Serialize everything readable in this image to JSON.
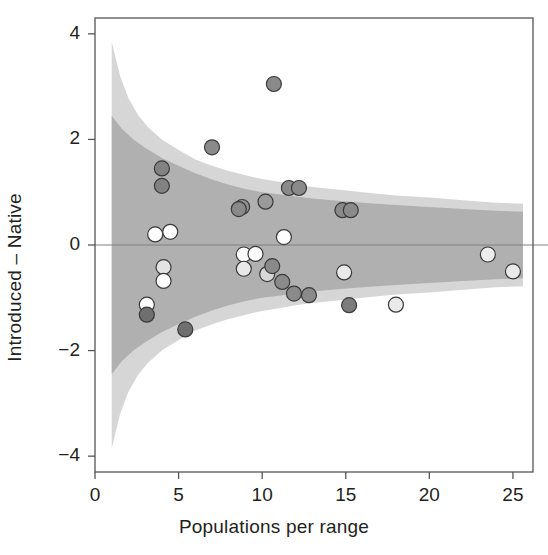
{
  "chart_data": {
    "type": "scatter",
    "title": "",
    "xlabel": "Populations per range",
    "ylabel": "Introduced – Native",
    "xlim": [
      0,
      26.2
    ],
    "ylim": [
      -4.3,
      4.3
    ],
    "xticks": [
      0,
      5,
      10,
      15,
      20,
      25
    ],
    "xtick_labels": [
      "0",
      "5",
      "10",
      "15",
      "20",
      "25"
    ],
    "yticks": [
      -4,
      -2,
      0,
      2,
      4
    ],
    "ytick_labels": [
      "-4",
      "-2",
      "0",
      "2",
      "4"
    ],
    "grid": false,
    "legend": null,
    "reference_line": {
      "y": 0,
      "color": "#808080"
    },
    "bands": [
      {
        "name": "outer-prediction-band",
        "color": "#d6d6d6",
        "upper": [
          [
            1.0,
            3.85
          ],
          [
            1.5,
            3.2
          ],
          [
            2.0,
            2.78
          ],
          [
            2.6,
            2.45
          ],
          [
            3.2,
            2.22
          ],
          [
            4.0,
            2.0
          ],
          [
            5.0,
            1.8
          ],
          [
            6.0,
            1.62
          ],
          [
            7.0,
            1.5
          ],
          [
            8.0,
            1.4
          ],
          [
            9.0,
            1.32
          ],
          [
            10.0,
            1.25
          ],
          [
            11.0,
            1.2
          ],
          [
            12.0,
            1.14
          ],
          [
            13.0,
            1.1
          ],
          [
            14.5,
            1.05
          ],
          [
            16.0,
            1.0
          ],
          [
            18.0,
            0.94
          ],
          [
            20.0,
            0.9
          ],
          [
            22.0,
            0.85
          ],
          [
            24.0,
            0.8
          ],
          [
            25.6,
            0.78
          ]
        ],
        "lower": [
          [
            1.0,
            -3.85
          ],
          [
            1.5,
            -3.2
          ],
          [
            2.0,
            -2.78
          ],
          [
            2.6,
            -2.45
          ],
          [
            3.2,
            -2.22
          ],
          [
            4.0,
            -2.0
          ],
          [
            5.0,
            -1.8
          ],
          [
            6.0,
            -1.62
          ],
          [
            7.0,
            -1.5
          ],
          [
            8.0,
            -1.4
          ],
          [
            9.0,
            -1.32
          ],
          [
            10.0,
            -1.25
          ],
          [
            11.0,
            -1.2
          ],
          [
            12.0,
            -1.14
          ],
          [
            13.0,
            -1.1
          ],
          [
            14.5,
            -1.05
          ],
          [
            16.0,
            -1.0
          ],
          [
            18.0,
            -0.94
          ],
          [
            20.0,
            -0.9
          ],
          [
            22.0,
            -0.85
          ],
          [
            24.0,
            -0.8
          ],
          [
            25.6,
            -0.78
          ]
        ]
      },
      {
        "name": "inner-confidence-band",
        "color": "#b0b0b0",
        "upper": [
          [
            1.0,
            2.45
          ],
          [
            1.6,
            2.2
          ],
          [
            2.3,
            2.0
          ],
          [
            3.0,
            1.84
          ],
          [
            4.0,
            1.65
          ],
          [
            5.0,
            1.5
          ],
          [
            6.0,
            1.36
          ],
          [
            7.0,
            1.24
          ],
          [
            8.0,
            1.14
          ],
          [
            9.0,
            1.06
          ],
          [
            10.0,
            1.0
          ],
          [
            11.0,
            0.96
          ],
          [
            12.0,
            0.92
          ],
          [
            13.0,
            0.88
          ],
          [
            14.5,
            0.84
          ],
          [
            16.0,
            0.8
          ],
          [
            18.0,
            0.76
          ],
          [
            20.0,
            0.72
          ],
          [
            22.0,
            0.68
          ],
          [
            24.0,
            0.65
          ],
          [
            25.6,
            0.63
          ]
        ],
        "lower": [
          [
            1.0,
            -2.45
          ],
          [
            1.6,
            -2.2
          ],
          [
            2.3,
            -2.0
          ],
          [
            3.0,
            -1.84
          ],
          [
            4.0,
            -1.65
          ],
          [
            5.0,
            -1.5
          ],
          [
            6.0,
            -1.36
          ],
          [
            7.0,
            -1.24
          ],
          [
            8.0,
            -1.14
          ],
          [
            9.0,
            -1.06
          ],
          [
            10.0,
            -1.0
          ],
          [
            11.0,
            -0.96
          ],
          [
            12.0,
            -0.92
          ],
          [
            13.0,
            -0.88
          ],
          [
            14.5,
            -0.84
          ],
          [
            16.0,
            -0.8
          ],
          [
            18.0,
            -0.76
          ],
          [
            20.0,
            -0.72
          ],
          [
            22.0,
            -0.68
          ],
          [
            24.0,
            -0.65
          ],
          [
            25.6,
            -0.63
          ]
        ]
      }
    ],
    "point_style": {
      "radius": 7.5,
      "stroke": "#3a3a3a",
      "stroke_width": 1.2
    },
    "points": [
      {
        "x": 10.7,
        "y": 3.05,
        "fill": "#8a8a8a"
      },
      {
        "x": 7.0,
        "y": 1.85,
        "fill": "#8a8a8a"
      },
      {
        "x": 4.0,
        "y": 1.45,
        "fill": "#828282"
      },
      {
        "x": 4.0,
        "y": 1.12,
        "fill": "#828282"
      },
      {
        "x": 11.6,
        "y": 1.08,
        "fill": "#8a8a8a"
      },
      {
        "x": 12.2,
        "y": 1.08,
        "fill": "#8a8a8a"
      },
      {
        "x": 10.2,
        "y": 0.82,
        "fill": "#9a9a9a"
      },
      {
        "x": 8.8,
        "y": 0.72,
        "fill": "#8f8f8f"
      },
      {
        "x": 8.6,
        "y": 0.68,
        "fill": "#8a8a8a"
      },
      {
        "x": 14.8,
        "y": 0.66,
        "fill": "#8a8a8a"
      },
      {
        "x": 15.3,
        "y": 0.66,
        "fill": "#8a8a8a"
      },
      {
        "x": 3.6,
        "y": 0.2,
        "fill": "#fdfdfd"
      },
      {
        "x": 4.5,
        "y": 0.25,
        "fill": "#fdfdfd"
      },
      {
        "x": 11.3,
        "y": 0.15,
        "fill": "#fdfdfd"
      },
      {
        "x": 8.9,
        "y": -0.18,
        "fill": "#fbfbfb"
      },
      {
        "x": 9.6,
        "y": -0.17,
        "fill": "#fbfbfb"
      },
      {
        "x": 8.9,
        "y": -0.45,
        "fill": "#e8e8e8"
      },
      {
        "x": 10.3,
        "y": -0.55,
        "fill": "#d8d8d8"
      },
      {
        "x": 4.1,
        "y": -0.42,
        "fill": "#e3e3e3"
      },
      {
        "x": 4.1,
        "y": -0.68,
        "fill": "#fdfdfd"
      },
      {
        "x": 10.6,
        "y": -0.4,
        "fill": "#8a8a8a"
      },
      {
        "x": 11.2,
        "y": -0.7,
        "fill": "#8a8a8a"
      },
      {
        "x": 11.9,
        "y": -0.92,
        "fill": "#8a8a8a"
      },
      {
        "x": 12.8,
        "y": -0.95,
        "fill": "#8a8a8a"
      },
      {
        "x": 14.9,
        "y": -0.52,
        "fill": "#eaeaea"
      },
      {
        "x": 23.5,
        "y": -0.18,
        "fill": "#ededed"
      },
      {
        "x": 25.0,
        "y": -0.5,
        "fill": "#e9e9e9"
      },
      {
        "x": 15.2,
        "y": -1.14,
        "fill": "#7c7c7c"
      },
      {
        "x": 18.0,
        "y": -1.13,
        "fill": "#eaeaea"
      },
      {
        "x": 3.1,
        "y": -1.13,
        "fill": "#fdfdfd"
      },
      {
        "x": 3.1,
        "y": -1.32,
        "fill": "#6f6f6f"
      },
      {
        "x": 5.4,
        "y": -1.6,
        "fill": "#6f6f6f"
      }
    ]
  },
  "axis": {
    "frame_color": "#555555",
    "tick_color": "#555555"
  }
}
